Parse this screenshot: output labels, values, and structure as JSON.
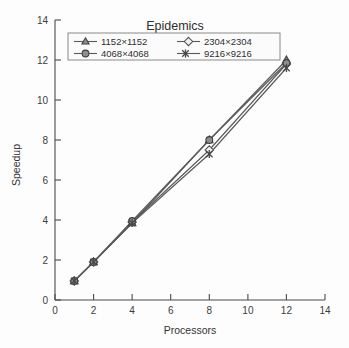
{
  "chart_data": {
    "type": "line",
    "title": "Epidemics",
    "xlabel": "Processors",
    "ylabel": "Speedup",
    "xlim": [
      0,
      14
    ],
    "ylim": [
      0,
      14
    ],
    "xticks": [
      "0",
      "2",
      "4",
      "6",
      "8",
      "10",
      "12",
      "14"
    ],
    "yticks": [
      "0",
      "2",
      "4",
      "6",
      "8",
      "10",
      "12",
      "14"
    ],
    "grid": false,
    "legend_position": "top-center",
    "x": [
      1,
      2,
      4,
      8,
      12
    ],
    "series": [
      {
        "name": "1152×1152",
        "marker": "triangle",
        "values": [
          0.95,
          1.9,
          3.85,
          8.0,
          12.0
        ]
      },
      {
        "name": "2304×2304",
        "marker": "diamond",
        "values": [
          0.95,
          1.9,
          3.9,
          7.5,
          11.8
        ]
      },
      {
        "name": "4068×4068",
        "marker": "circle",
        "values": [
          0.95,
          1.9,
          3.95,
          8.0,
          11.85
        ]
      },
      {
        "name": "9216×9216",
        "marker": "cross",
        "values": [
          0.95,
          1.9,
          3.85,
          7.3,
          11.6
        ]
      }
    ]
  },
  "legend": {
    "entries": [
      {
        "label": "1152×1152",
        "marker": "triangle-marker"
      },
      {
        "label": "2304×2304",
        "marker": "diamond-marker"
      },
      {
        "label": "4068×4068",
        "marker": "circle-marker"
      },
      {
        "label": "9216×9216",
        "marker": "cross-marker"
      }
    ]
  },
  "colors": {
    "background": "#fdfdfd",
    "axis": "#4a4a4a",
    "line": "#5a5a5a",
    "marker_fill": "#8e8e8e",
    "marker_open_fill": "#f2f2f2",
    "text": "#2f2f2f"
  }
}
